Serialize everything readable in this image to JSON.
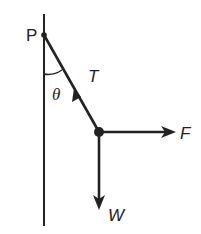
{
  "diagram": {
    "labels": {
      "pivot": "P",
      "tension": "T",
      "angle": "θ",
      "force": "F",
      "weight": "W"
    },
    "colors": {
      "stroke": "#222222",
      "background": "#ffffff"
    }
  }
}
